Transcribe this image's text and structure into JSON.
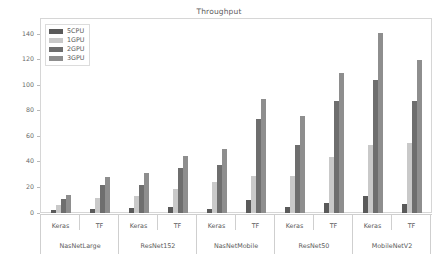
{
  "chart_data": {
    "type": "bar",
    "title": "Throughput",
    "xlabel": "",
    "ylabel": "images/sec",
    "ylim": [
      0,
      152
    ],
    "yticks": [
      0,
      20,
      40,
      60,
      80,
      100,
      120,
      140
    ],
    "ytick_labels": [
      "0",
      "20",
      "40",
      "60",
      "80",
      "100",
      "120",
      "140"
    ],
    "grid": false,
    "legend_position": "upper left",
    "group_labels": [
      "NasNetLarge",
      "ResNet152",
      "NasNetMobile",
      "ResNet50",
      "MobileNetV2"
    ],
    "subgroup_labels": [
      "Keras",
      "TF"
    ],
    "categories": [
      "NasNetLarge / Keras",
      "NasNetLarge / TF",
      "ResNet152 / Keras",
      "ResNet152 / TF",
      "NasNetMobile / Keras",
      "NasNetMobile / TF",
      "ResNet50 / Keras",
      "ResNet50 / TF",
      "MobileNetV2 / Keras",
      "MobileNetV2 / TF"
    ],
    "series": [
      {
        "name": "5CPU",
        "color": "#5a5a5a",
        "values": [
          2,
          3,
          4,
          5,
          3,
          10,
          5,
          8,
          13,
          7
        ]
      },
      {
        "name": "1GPU",
        "color": "#c9c9c9",
        "values": [
          6,
          12,
          13,
          19,
          24,
          29,
          29,
          44,
          53,
          55
        ]
      },
      {
        "name": "2GPU",
        "color": "#6e6e6e",
        "values": [
          11,
          22,
          22,
          35,
          38,
          74,
          53,
          88,
          104,
          88
        ]
      },
      {
        "name": "3GPU",
        "color": "#8e8e8e",
        "values": [
          14,
          28,
          31,
          45,
          50,
          89,
          76,
          110,
          141,
          120
        ]
      }
    ]
  },
  "legend": {
    "entries": [
      {
        "label": "5CPU",
        "color": "#5a5a5a"
      },
      {
        "label": "1GPU",
        "color": "#c9c9c9"
      },
      {
        "label": "2GPU",
        "color": "#6e6e6e"
      },
      {
        "label": "3GPU",
        "color": "#8e8e8e"
      }
    ]
  }
}
